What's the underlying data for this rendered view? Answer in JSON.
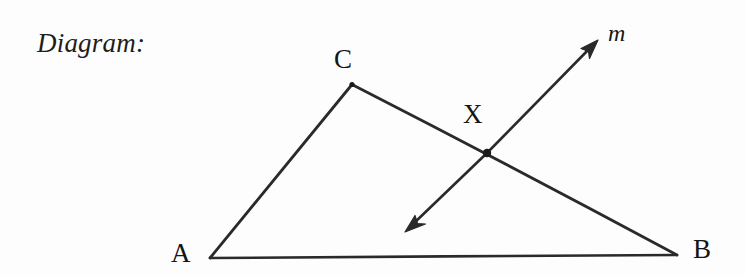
{
  "page": {
    "background_color": "#fdfdfd",
    "ink_color": "#2a2a2a",
    "width": 745,
    "height": 277
  },
  "caption": {
    "text": "Diagram:"
  },
  "figure": {
    "labels": {
      "a": "A",
      "b": "B",
      "c": "C",
      "x": "X",
      "m": "m"
    },
    "points": {
      "A": {
        "x": 210,
        "y": 258
      },
      "B": {
        "x": 677,
        "y": 255
      },
      "C": {
        "x": 352,
        "y": 84
      },
      "X": {
        "x": 487,
        "y": 153
      },
      "m_arrow_upper_tip": {
        "x": 598,
        "y": 40
      },
      "m_arrow_lower_tip": {
        "x": 405,
        "y": 232
      }
    },
    "segments": [
      {
        "name": "AB",
        "from": "A",
        "to": "B"
      },
      {
        "name": "AC",
        "from": "A",
        "to": "C"
      },
      {
        "name": "CB",
        "from": "C",
        "to": "B"
      }
    ],
    "line_m": {
      "name": "m",
      "through": "X",
      "arrowheads": "both",
      "from": "m_arrow_lower_tip",
      "to": "m_arrow_upper_tip"
    },
    "marked_point": {
      "name": "X",
      "style": "filled-dot"
    }
  }
}
